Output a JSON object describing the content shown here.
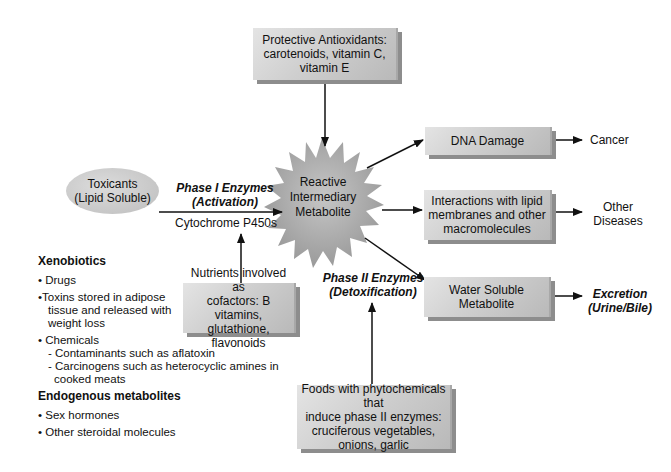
{
  "diagram": {
    "antioxidants_box": {
      "lines": [
        "Protective Antioxidants:",
        "carotenoids, vitamin C,",
        "vitamin E"
      ]
    },
    "toxicants_oval": {
      "lines": [
        "Toxicants",
        "(Lipid Soluble)"
      ]
    },
    "phase1": {
      "title": "Phase I Enzymes",
      "subtitle": "(Activation)",
      "enzyme": "Cytochrome P450s"
    },
    "center_node": {
      "lines": [
        "Reactive",
        "Intermediary",
        "Metabolite"
      ]
    },
    "nutrients_box": {
      "lines": [
        "Nutrients involved as",
        "cofactors: B vitamins,",
        "glutathione, flavonoids"
      ]
    },
    "phase2": {
      "title": "Phase II Enzymes",
      "subtitle": "(Detoxification)"
    },
    "foods_box": {
      "lines": [
        "Foods with phytochemicals that",
        "induce phase II enzymes:",
        "cruciferous vegetables,",
        "onions, garlic"
      ]
    },
    "outcomes": [
      {
        "box": [
          "DNA Damage"
        ],
        "result": [
          "Cancer"
        ],
        "result_style": "plain"
      },
      {
        "box": [
          "Interactions with lipid",
          "membranes and other",
          "macromolecules"
        ],
        "result": [
          "Other",
          "Diseases"
        ],
        "result_style": "plain"
      },
      {
        "box": [
          "Water Soluble",
          "Metabolite"
        ],
        "result": [
          "Excretion",
          "(Urine/Bile)"
        ],
        "result_style": "bold-italic"
      }
    ],
    "sources_list": {
      "xenobiotics_heading": "Xenobiotics",
      "xenobiotics": [
        "• Drugs",
        "•Toxins stored in adipose",
        "tissue and released with",
        "weight loss",
        "• Chemicals",
        "- Contaminants such as aflatoxin",
        "- Carcinogens such as heterocyclic amines in",
        "cooked meats"
      ],
      "endogenous_heading": "Endogenous metabolites",
      "endogenous": [
        "• Sex hormones",
        "• Other steroidal molecules"
      ]
    },
    "colors": {
      "box_fill": "#cfcfcf",
      "box_shadow": "#8d8d8d",
      "star_fill": "#a9a9a9",
      "arrow": "#111111"
    }
  }
}
